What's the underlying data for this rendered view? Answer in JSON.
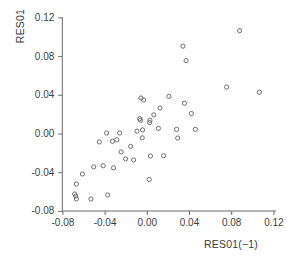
{
  "chart_data": {
    "type": "scatter",
    "title": "",
    "xlabel": "RES01(−1)",
    "ylabel": "RES01",
    "xlim": [
      -0.088,
      0.128
    ],
    "ylim": [
      -0.082,
      0.124
    ],
    "xticks": [
      "-0.08",
      "-0.04",
      "0.00",
      "0.04",
      "0.08",
      "0.12"
    ],
    "xtick_values": [
      -0.08,
      -0.04,
      0.0,
      0.04,
      0.08,
      0.12
    ],
    "yticks": [
      "0.12",
      "0.08",
      "0.04",
      "0.00",
      "-0.04",
      "-0.08"
    ],
    "ytick_values": [
      0.12,
      0.08,
      0.04,
      0.0,
      -0.04,
      -0.08
    ],
    "grid": false,
    "legend": null,
    "marker": "open-circle",
    "marker_color": "#6e6e6e",
    "points": [
      {
        "x": -0.0615,
        "y": -0.0413
      },
      {
        "x": -0.0672,
        "y": -0.0517
      },
      {
        "x": -0.0688,
        "y": -0.062
      },
      {
        "x": -0.0678,
        "y": -0.0641
      },
      {
        "x": -0.0672,
        "y": -0.0672
      },
      {
        "x": -0.0535,
        "y": -0.0672
      },
      {
        "x": -0.0375,
        "y": -0.063
      },
      {
        "x": -0.0508,
        "y": -0.034
      },
      {
        "x": -0.0455,
        "y": -0.0082
      },
      {
        "x": -0.0385,
        "y": 0.001
      },
      {
        "x": -0.033,
        "y": -0.0075
      },
      {
        "x": -0.032,
        "y": -0.035
      },
      {
        "x": -0.0262,
        "y": 0.001
      },
      {
        "x": -0.0248,
        "y": -0.0185
      },
      {
        "x": -0.0205,
        "y": -0.0258
      },
      {
        "x": -0.013,
        "y": -0.0268
      },
      {
        "x": -0.006,
        "y": 0.0372
      },
      {
        "x": -0.0035,
        "y": 0.0352
      },
      {
        "x": -0.0045,
        "y": 0.0042
      },
      {
        "x": -0.0048,
        "y": -0.004
      },
      {
        "x": -0.0072,
        "y": 0.0158
      },
      {
        "x": -0.0065,
        "y": 0.0142
      },
      {
        "x": 0.0022,
        "y": 0.0118
      },
      {
        "x": 0.0025,
        "y": 0.0142
      },
      {
        "x": 0.003,
        "y": -0.0228
      },
      {
        "x": 0.0018,
        "y": -0.047
      },
      {
        "x": 0.012,
        "y": 0.0268
      },
      {
        "x": 0.0155,
        "y": -0.0225
      },
      {
        "x": 0.0205,
        "y": 0.039
      },
      {
        "x": 0.0278,
        "y": 0.0048
      },
      {
        "x": 0.0288,
        "y": -0.0042
      },
      {
        "x": 0.0352,
        "y": 0.0318
      },
      {
        "x": 0.0368,
        "y": 0.0758
      },
      {
        "x": 0.0338,
        "y": 0.0908
      },
      {
        "x": 0.0418,
        "y": 0.0212
      },
      {
        "x": 0.0455,
        "y": 0.0048
      },
      {
        "x": 0.0752,
        "y": 0.0485
      },
      {
        "x": 0.0875,
        "y": 0.1068
      },
      {
        "x": 0.1062,
        "y": 0.0432
      },
      {
        "x": -0.0158,
        "y": -0.0128
      },
      {
        "x": -0.0288,
        "y": -0.006
      },
      {
        "x": 0.0105,
        "y": 0.0058
      },
      {
        "x": -0.0098,
        "y": 0.003
      },
      {
        "x": 0.0062,
        "y": 0.0198
      },
      {
        "x": -0.0418,
        "y": -0.0328
      }
    ]
  }
}
